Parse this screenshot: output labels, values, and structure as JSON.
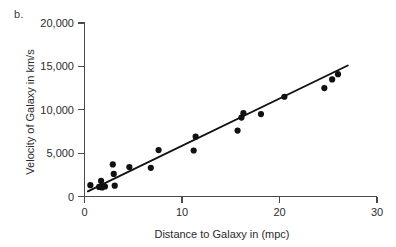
{
  "figure": {
    "panel_label": "b."
  },
  "chart_data": {
    "type": "scatter",
    "title": "",
    "xlabel": "Distance to Galaxy in (mpc)",
    "ylabel": "Velocity of Galaxy in km/s",
    "xlim": [
      0,
      30
    ],
    "ylim": [
      0,
      20000
    ],
    "xticks": [
      0,
      10,
      20,
      30
    ],
    "yticks": [
      0,
      5000,
      10000,
      15000,
      20000
    ],
    "xtick_labels": [
      "0",
      "10",
      "20",
      "30"
    ],
    "ytick_labels": [
      "0",
      "5,000",
      "10,000",
      "15,000",
      "20,000"
    ],
    "grid": false,
    "legend": null,
    "point_color": "#111111",
    "line_color": "#111111",
    "x": [
      0.6,
      1.5,
      1.7,
      1.8,
      2.1,
      2.9,
      3.0,
      3.1,
      4.6,
      6.8,
      7.6,
      11.2,
      11.4,
      15.7,
      16.1,
      16.3,
      18.1,
      20.5,
      24.6,
      25.4,
      26.0
    ],
    "y": [
      1300,
      1100,
      1800,
      1050,
      1150,
      3700,
      2600,
      1250,
      3400,
      3300,
      5350,
      5300,
      6900,
      7600,
      9100,
      9600,
      9500,
      11500,
      12500,
      13500,
      14100
    ],
    "series": [
      {
        "name": "Galaxies",
        "points": [
          {
            "x": 0.6,
            "y": 1300
          },
          {
            "x": 1.5,
            "y": 1100
          },
          {
            "x": 1.7,
            "y": 1800
          },
          {
            "x": 1.8,
            "y": 1050
          },
          {
            "x": 2.1,
            "y": 1150
          },
          {
            "x": 2.9,
            "y": 3700
          },
          {
            "x": 3.0,
            "y": 2600
          },
          {
            "x": 3.1,
            "y": 1250
          },
          {
            "x": 4.6,
            "y": 3400
          },
          {
            "x": 6.8,
            "y": 3300
          },
          {
            "x": 7.6,
            "y": 5350
          },
          {
            "x": 11.2,
            "y": 5300
          },
          {
            "x": 11.4,
            "y": 6900
          },
          {
            "x": 15.7,
            "y": 7600
          },
          {
            "x": 16.1,
            "y": 9100
          },
          {
            "x": 16.3,
            "y": 9600
          },
          {
            "x": 18.1,
            "y": 9500
          },
          {
            "x": 20.5,
            "y": 11500
          },
          {
            "x": 24.6,
            "y": 12500
          },
          {
            "x": 25.4,
            "y": 13500
          },
          {
            "x": 26.0,
            "y": 14100
          }
        ]
      }
    ],
    "trendline": {
      "type": "linear",
      "x_start": 0.35,
      "y_start": 600,
      "x_end": 27.0,
      "y_end": 15100
    }
  }
}
